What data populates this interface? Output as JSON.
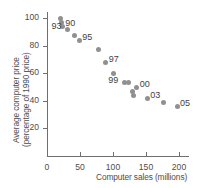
{
  "chart_data": {
    "type": "scatter",
    "title": "",
    "xlabel": "Computer sales (millions)",
    "ylabel_line1": "Average computer price",
    "ylabel_line2": "(percentage of 1990 price)",
    "xlim": [
      0,
      215
    ],
    "ylim": [
      0,
      108
    ],
    "xticks": [
      "0",
      "50",
      "100",
      "150",
      "200"
    ],
    "xtick_values": [
      0,
      50,
      100,
      150,
      200
    ],
    "yticks": [
      "20",
      "40",
      "60",
      "80",
      "100"
    ],
    "ytick_values": [
      20,
      40,
      60,
      80,
      100
    ],
    "grid": false,
    "legend": "none",
    "marker_color": "#909090",
    "axis_color": "#6f6f6f",
    "points": [
      {
        "x": 21,
        "y": 100,
        "label": ""
      },
      {
        "x": 22,
        "y": 97,
        "label": ""
      },
      {
        "x": 23,
        "y": 94,
        "label": "90"
      },
      {
        "x": 31,
        "y": 92,
        "label": "93"
      },
      {
        "x": 41,
        "y": 87,
        "label": ""
      },
      {
        "x": 49,
        "y": 84,
        "label": "95"
      },
      {
        "x": 78,
        "y": 77,
        "label": ""
      },
      {
        "x": 89,
        "y": 68,
        "label": "97"
      },
      {
        "x": 100,
        "y": 60,
        "label": ""
      },
      {
        "x": 117,
        "y": 53,
        "label": "99"
      },
      {
        "x": 123,
        "y": 53,
        "label": ""
      },
      {
        "x": 136,
        "y": 50,
        "label": "00"
      },
      {
        "x": 129,
        "y": 47,
        "label": ""
      },
      {
        "x": 131,
        "y": 44,
        "label": ""
      },
      {
        "x": 152,
        "y": 42,
        "label": "03"
      },
      {
        "x": 177,
        "y": 39,
        "label": ""
      },
      {
        "x": 197,
        "y": 36,
        "label": "05"
      }
    ],
    "point_labels": [
      "90",
      "93",
      "95",
      "97",
      "99",
      "00",
      "03",
      "05"
    ]
  }
}
